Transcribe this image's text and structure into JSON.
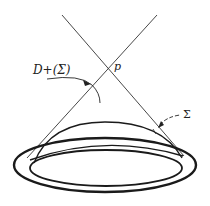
{
  "diagram": {
    "type": "spacetime-domain-of-dependence",
    "labels": {
      "point": "p",
      "domain": "D+(Σ)",
      "surface": "Σ"
    },
    "colors": {
      "stroke": "#222222",
      "background": "#ffffff"
    }
  }
}
